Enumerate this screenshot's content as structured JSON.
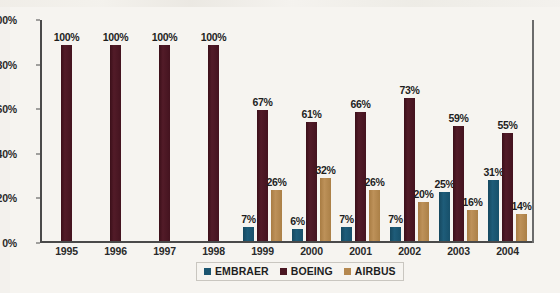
{
  "chart_data": {
    "type": "bar",
    "title": "",
    "subtitle": "",
    "xlabel": "",
    "ylabel": "",
    "ylim": [
      0,
      100
    ],
    "ytick_labels": [
      "0%",
      "20%",
      "40%",
      "60%",
      "80%",
      "100%"
    ],
    "ytick_values": [
      0,
      20,
      40,
      60,
      80,
      100
    ],
    "grid": false,
    "legend_position": "bottom-center",
    "categories": [
      "1995",
      "1996",
      "1997",
      "1998",
      "1999",
      "2000",
      "2001",
      "2002",
      "2003",
      "2004"
    ],
    "series": [
      {
        "name": "EMBRAER",
        "color": "#1b5570",
        "values": [
          null,
          null,
          null,
          null,
          7,
          6,
          7,
          7,
          25,
          31
        ],
        "labels": [
          "",
          "",
          "",
          "",
          "7%",
          "6%",
          "7%",
          "7%",
          "25%",
          "31%"
        ]
      },
      {
        "name": "BOEING",
        "color": "#4a1622",
        "values": [
          100,
          100,
          100,
          100,
          67,
          61,
          66,
          73,
          59,
          55
        ],
        "labels": [
          "100%",
          "100%",
          "100%",
          "100%",
          "67%",
          "61%",
          "66%",
          "73%",
          "59%",
          "55%"
        ]
      },
      {
        "name": "AIRBUS",
        "color": "#b5884f",
        "values": [
          null,
          null,
          null,
          null,
          26,
          32,
          26,
          20,
          16,
          14
        ],
        "labels": [
          "",
          "",
          "",
          "",
          "26%",
          "32%",
          "26%",
          "20%",
          "16%",
          "14%"
        ]
      }
    ]
  },
  "legend": {
    "items": [
      {
        "label": "EMBRAER",
        "color": "#1b5570"
      },
      {
        "label": "BOEING",
        "color": "#4a1622"
      },
      {
        "label": "AIRBUS",
        "color": "#b5884f"
      }
    ]
  },
  "axis": {
    "y_labels": [
      "100%",
      "80%",
      "60%",
      "40%",
      "20%",
      "0%"
    ]
  }
}
